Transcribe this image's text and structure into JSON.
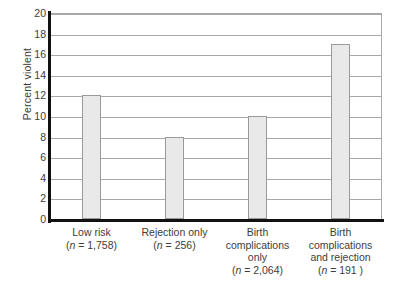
{
  "chart_data": {
    "type": "bar",
    "title": "",
    "xlabel": "",
    "ylabel": "Percent violent",
    "ylim": [
      0,
      20
    ],
    "ytick_step": 2,
    "yticks": [
      20,
      18,
      16,
      14,
      12,
      10,
      8,
      6,
      4,
      2,
      0
    ],
    "grid": true,
    "legend": "none",
    "categories": [
      "Low risk",
      "Rejection only",
      "Birth complications only",
      "Birth complications and rejection"
    ],
    "values": [
      12,
      8,
      10,
      17
    ],
    "sample_sizes": [
      "(n = 1,758)",
      "(n = 256)",
      "(n = 2,064)",
      "(n = 191 )"
    ],
    "bars": [
      {
        "label_lines": [
          "Low risk"
        ],
        "n_prefix": "(",
        "n_italic": "n",
        "n_suffix": " = 1,758)",
        "value": 12
      },
      {
        "label_lines": [
          "Rejection only"
        ],
        "n_prefix": "(",
        "n_italic": "n",
        "n_suffix": " = 256)",
        "value": 8
      },
      {
        "label_lines": [
          "Birth",
          "complications",
          "only"
        ],
        "n_prefix": "(",
        "n_italic": "n",
        "n_suffix": " = 2,064)",
        "value": 10
      },
      {
        "label_lines": [
          "Birth",
          "complications",
          "and rejection"
        ],
        "n_prefix": "(",
        "n_italic": "n",
        "n_suffix": " = 191 )",
        "value": 17
      }
    ],
    "colors": {
      "bar_fill": "#e9e9e9",
      "bar_stroke": "#9a9a9a",
      "grid": "#a8a8a8",
      "axis": "#111111",
      "text": "#3d3d3d",
      "background": "#ffffff"
    }
  }
}
